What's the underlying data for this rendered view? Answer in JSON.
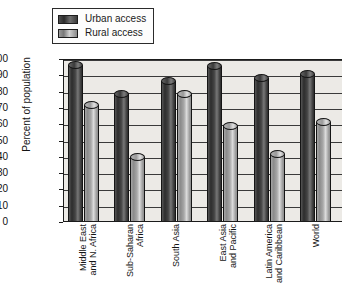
{
  "chart_data": {
    "type": "bar",
    "title": "",
    "subtitle": "",
    "xlabel": "",
    "ylabel": "Percent of population",
    "ylim": [
      0,
      100
    ],
    "ytick_step": 10,
    "yticks": [
      "100",
      "90",
      "80",
      "70",
      "60",
      "50",
      "40",
      "30",
      "20",
      "10",
      "0"
    ],
    "grid": true,
    "legend_position": "top-left",
    "orientation": "vertical",
    "bar_style": "3d-cylinder",
    "categories": [
      "Middle East and N. Africa",
      "Sub-Saharan Africa",
      "South Asia",
      "East Asia and Pacific",
      "Latin America and Caribbean",
      "World"
    ],
    "category_lines": [
      [
        "Middle East",
        "and N. Africa"
      ],
      [
        "Sub-Saharan",
        "Africa"
      ],
      [
        "South Asia"
      ],
      [
        "East Asia",
        "and Pacific"
      ],
      [
        "Latin America",
        "and Caribbean"
      ],
      [
        "World"
      ]
    ],
    "series": [
      {
        "name": "Urban access",
        "color": "#2d2d2d",
        "values": [
          96,
          78,
          86,
          95,
          88,
          90
        ]
      },
      {
        "name": "Rural access",
        "color": "#a8a8a8",
        "values": [
          71,
          39,
          78,
          58,
          41,
          61
        ]
      }
    ]
  },
  "legend": {
    "items": [
      {
        "label": "Urban access",
        "swatch": "urban-swatch"
      },
      {
        "label": "Rural access",
        "swatch": "rural-swatch"
      }
    ]
  },
  "axis": {
    "y_title": "Percent of population"
  },
  "colors": {
    "plot_background": "#eceae6",
    "axis_line": "#1b1b1b",
    "gridline": "#3a3a3a",
    "urban_bar": "#2d2d2d",
    "rural_bar": "#a8a8a8",
    "page_background": "#ffffff",
    "text": "#141414"
  }
}
